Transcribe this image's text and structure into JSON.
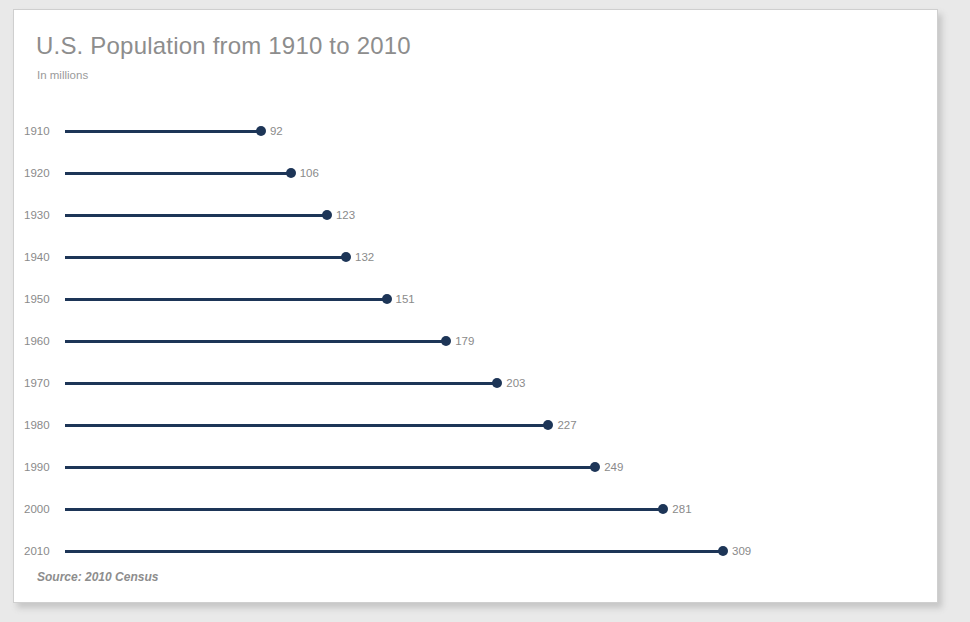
{
  "card": {
    "title": "U.S. Population from 1910 to 2010",
    "subtitle": "In millions",
    "source": "Source: 2010 Census",
    "accent_color": "#1d3557",
    "text_color": "#8a8a8a",
    "background_color": "#ffffff",
    "page_background_color": "#e9e9e9"
  },
  "chart_data": {
    "type": "bar",
    "orientation": "horizontal",
    "style": "lollipop",
    "title": "U.S. Population from 1910 to 2010",
    "subtitle": "In millions",
    "xlabel": "",
    "ylabel": "",
    "units": "millions",
    "grid": false,
    "legend": false,
    "axis_ticks_visible": false,
    "value_labels_visible": true,
    "xlim": [
      0,
      340
    ],
    "categories": [
      "1910",
      "1920",
      "1930",
      "1940",
      "1950",
      "1960",
      "1970",
      "1980",
      "1990",
      "2000",
      "2010"
    ],
    "values": [
      92,
      106,
      123,
      132,
      151,
      179,
      203,
      227,
      249,
      281,
      309
    ],
    "series": [
      {
        "name": "U.S. Population",
        "color": "#1d3557",
        "values": [
          92,
          106,
          123,
          132,
          151,
          179,
          203,
          227,
          249,
          281,
          309
        ]
      }
    ],
    "points": [
      {
        "category": "1910",
        "value": 92,
        "label": "92"
      },
      {
        "category": "1920",
        "value": 106,
        "label": "106"
      },
      {
        "category": "1930",
        "value": 123,
        "label": "123"
      },
      {
        "category": "1940",
        "value": 132,
        "label": "132"
      },
      {
        "category": "1950",
        "value": 151,
        "label": "151"
      },
      {
        "category": "1960",
        "value": 179,
        "label": "179"
      },
      {
        "category": "1970",
        "value": 203,
        "label": "203"
      },
      {
        "category": "1980",
        "value": 227,
        "label": "227"
      },
      {
        "category": "1990",
        "value": 249,
        "label": "249"
      },
      {
        "category": "2000",
        "value": 281,
        "label": "281"
      },
      {
        "category": "2010",
        "value": 309,
        "label": "309"
      }
    ],
    "annotations": [
      "Source: 2010 Census"
    ]
  }
}
